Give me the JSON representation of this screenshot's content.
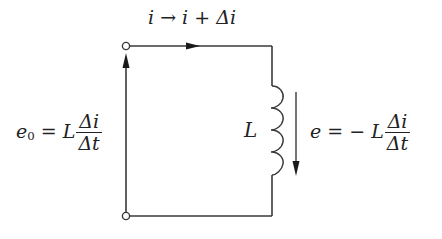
{
  "diagram": {
    "type": "inductor-circuit",
    "colors": {
      "wire": "#3a3a3a",
      "text": "#222222",
      "background": "#ffffff"
    },
    "current_label": {
      "i": "i",
      "arrow": "→",
      "i2": "i",
      "plus": "+",
      "delta_i": "Δi"
    },
    "source_label": {
      "e": "e",
      "sub": "0",
      "equals": "=",
      "L": "L",
      "num": "Δi",
      "den": "Δt"
    },
    "inductor_label": "L",
    "emf_label": {
      "e": "e",
      "equals": "=",
      "minus": "−",
      "L": "L",
      "num": "Δi",
      "den": "Δt"
    }
  }
}
